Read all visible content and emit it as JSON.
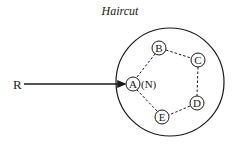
{
  "title": "Haircut",
  "source_label": "R",
  "root_annotation": "(N)",
  "colors": {
    "ink": "#1a1a1a",
    "background": "#ffffff"
  },
  "nodes": [
    {
      "id": "A",
      "label": "A"
    },
    {
      "id": "B",
      "label": "B"
    },
    {
      "id": "C",
      "label": "C"
    },
    {
      "id": "D",
      "label": "D"
    },
    {
      "id": "E",
      "label": "E"
    }
  ],
  "edges": [
    {
      "from": "R",
      "to": "A",
      "style": "solid-arrow"
    },
    {
      "from": "A",
      "to": "B",
      "style": "dashed"
    },
    {
      "from": "B",
      "to": "C",
      "style": "dashed"
    },
    {
      "from": "C",
      "to": "D",
      "style": "dashed"
    },
    {
      "from": "D",
      "to": "E",
      "style": "dashed"
    },
    {
      "from": "E",
      "to": "A",
      "style": "dashed"
    }
  ]
}
